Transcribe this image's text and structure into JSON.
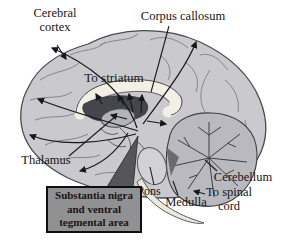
{
  "figure": {
    "type": "brain-midsagittal-pathway-diagram"
  },
  "labels": {
    "cerebral_cortex": "Cerebral\ncortex",
    "corpus_callosum": "Corpus callosum",
    "to_striatum": "To striatum",
    "thalamus": "Thalamus",
    "pons": "Pons",
    "medulla": "Medulla",
    "cerebellum": "Cerebellum",
    "to_spinal_cord": "To spinal\ncord"
  },
  "callout": {
    "line1": "Substantia nigra",
    "line2": "and ventral",
    "line3": "tegmental area"
  },
  "colors": {
    "background": "#ffffff",
    "brain_fill": "#c9c9ce",
    "brain_outline": "#4a4a50",
    "gyri_stroke": "#85858d",
    "corpus_callosum_fill": "#f2efe4",
    "ventricle_dark": "#45454d",
    "thalamus_fill": "#b3b3ba",
    "cerebellum_fill": "#b9b9bf",
    "cerebellum_branches": "#3e3e44",
    "pons_fill": "#d2d2d6",
    "medulla_fill": "#ece9df",
    "arrow_color": "#17171b",
    "callout_fill": "#919193",
    "callout_border": "#0e0e0e",
    "callout_pointer": "#55555a",
    "label_text": "#161616"
  }
}
